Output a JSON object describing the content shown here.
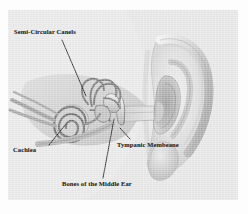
{
  "figure": {
    "medium": "grayscale scanned illustration",
    "colors": {
      "page": "#ffffff",
      "plate": "#e4e4e4",
      "label_text": "#2b2b2b",
      "leader_line": "#1e1e1e",
      "pinna_light": "#dcdcdc",
      "pinna_mid": "#bdbdbd",
      "pinna_shadow": "#9a9a9a",
      "inner_ear_dark": "#8f8f8f",
      "inner_ear_line": "#6e6e6e",
      "canal_fill": "#cfcfcf"
    }
  },
  "labels": [
    {
      "id": "semi-circular-canals",
      "text": "Semi-Circular Canels",
      "leader": {
        "x1": 62,
        "y1": 40,
        "x2": 86,
        "y2": 96
      }
    },
    {
      "id": "cochlea",
      "text": "Cachlea",
      "leader": {
        "x1": 49,
        "y1": 145,
        "x2": 66,
        "y2": 124
      }
    },
    {
      "id": "bones-of-the-middle-ear",
      "text": "Bones of the Middle Ear",
      "leader": {
        "x1": 103,
        "y1": 178,
        "x2": 114,
        "y2": 119
      }
    },
    {
      "id": "tympanic-membrane",
      "text": "Tympanic Membeane",
      "leader": {
        "x1": 130,
        "y1": 139,
        "x2": 120,
        "y2": 128
      }
    }
  ],
  "structures": [
    {
      "id": "pinna",
      "name": "outer ear / pinna"
    },
    {
      "id": "ear-canal",
      "name": "external auditory canal"
    },
    {
      "id": "tympanic-membrane",
      "name": "eardrum"
    },
    {
      "id": "ossicles",
      "name": "bones of the middle ear"
    },
    {
      "id": "semicircular-canals",
      "name": "semi-circular canals"
    },
    {
      "id": "cochlea",
      "name": "cochlea"
    },
    {
      "id": "eustachian-tube",
      "name": "eustachian tube"
    },
    {
      "id": "earlobe",
      "name": "earlobe"
    }
  ]
}
